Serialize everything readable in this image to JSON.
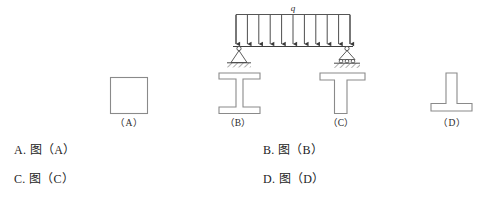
{
  "figure": {
    "load_label": "q",
    "load_arrow_count": 11,
    "left_support": "pin-support",
    "right_support": "roller-support",
    "stroke_color": "#555555",
    "hatch_color": "#4a4a4a",
    "shapes": [
      {
        "id": "A",
        "caption": "（A）",
        "type": "rectangle-section"
      },
      {
        "id": "B",
        "caption": "（B）",
        "type": "i-beam-section"
      },
      {
        "id": "C",
        "caption": "（C）",
        "type": "t-section"
      },
      {
        "id": "D",
        "caption": "（D）",
        "type": "inverted-t-section"
      }
    ]
  },
  "options": {
    "a": "A. 图（A）",
    "b": "B. 图（B）",
    "c": "C. 图（C）",
    "d": "D. 图（D）"
  }
}
